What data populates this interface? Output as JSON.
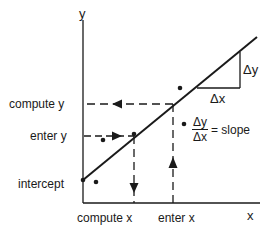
{
  "diagram": {
    "type": "linear-regression-explanation",
    "axes": {
      "x_label": "x",
      "y_label": "y"
    },
    "y_annotations": {
      "compute_y": "compute y",
      "enter_y": "enter y",
      "intercept": "intercept"
    },
    "x_annotations": {
      "compute_x": "compute x",
      "enter_x": "enter x"
    },
    "slope_triangle": {
      "delta_x": "Δx",
      "delta_y": "Δy"
    },
    "slope_formula": {
      "numerator": "Δy",
      "denominator": "Δx",
      "equals_text": "= slope"
    },
    "colors": {
      "line": "#1a1a1a",
      "background": "#ffffff"
    }
  }
}
